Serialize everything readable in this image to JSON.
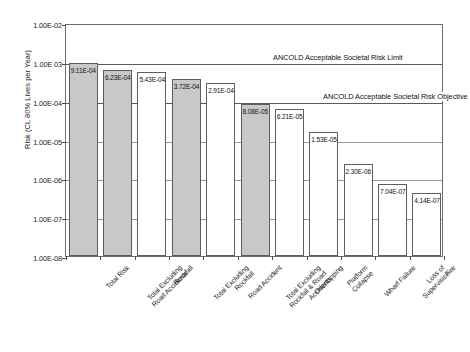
{
  "chart_data": {
    "type": "bar",
    "title": "",
    "xlabel": "",
    "ylabel": "Risk (CL 80% Lives per Year)",
    "yscale": "log",
    "ylim": [
      1e-08,
      0.01
    ],
    "grid": true,
    "legend": "none",
    "ytick_labels": [
      "1.00E-02",
      "1.00E 03",
      "1.00E-04",
      "1.00E-05",
      "1.00E-06",
      "1.00E-07",
      "1.00E-08"
    ],
    "ytick_values": [
      0.01,
      0.001,
      0.0001,
      1e-05,
      1e-06,
      1e-07,
      1e-08
    ],
    "categories": [
      "Total Risk",
      "Total Excluding Road Accidents",
      "Rockfall",
      "Total Excluding Rockfall",
      "Road Accident",
      "Total Excluding Rockfall & Road Accidents",
      "Overtopping",
      "Platform Collapse",
      "Wharf Failure",
      "Loss of Supervision",
      "Fire"
    ],
    "values": [
      0.000911,
      0.000623,
      0.000543,
      0.000372,
      0.000291,
      8.08e-05,
      6.21e-05,
      1.53e-05,
      2.3e-06,
      7.04e-07,
      4.14e-07
    ],
    "data_labels": [
      "9.11E-04",
      "6.23E-04",
      "5.43E-04",
      "3.72E-04",
      "2.91E-04",
      "8.08E-05",
      "6.21E-05",
      "1.53E-05",
      "2.30E-06",
      "7.04E-07",
      "4.14E-07"
    ],
    "bar_fills": [
      "shaded",
      "shaded",
      "white",
      "shaded",
      "white",
      "shaded",
      "white",
      "white",
      "white",
      "white",
      "white"
    ],
    "annotations": [
      {
        "text": "ANCOLD Acceptable Societal Risk Limit",
        "value": 0.001
      },
      {
        "text": "ANCOLD Acceptable Societal Risk Objective",
        "value": 0.0001
      }
    ]
  },
  "colors": {
    "bar_shaded": "#c8c8c8",
    "bar_white": "#ffffff",
    "bar_border": "#5d5d5d",
    "grid": "#9a9a9a",
    "axis": "#6d6d6d",
    "text": "#1a1a1a"
  }
}
